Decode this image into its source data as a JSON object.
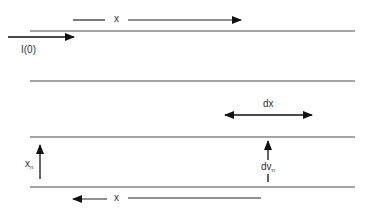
{
  "diagram": {
    "type": "transmission-line-schematic",
    "colors": {
      "line": "#4a4a4a",
      "arrow": "#111111",
      "text": "#333333",
      "background": "#ffffff"
    },
    "conductors": [
      {
        "id": "line-1",
        "y": 31,
        "x1": 30,
        "x2": 355
      },
      {
        "id": "line-2",
        "y": 81,
        "x1": 30,
        "x2": 355
      },
      {
        "id": "line-3",
        "y": 137,
        "x1": 30,
        "x2": 355
      },
      {
        "id": "line-4",
        "y": 187,
        "x1": 30,
        "x2": 355
      }
    ],
    "labels": {
      "top_x": "x",
      "current": "I(0)",
      "dx": "dx",
      "xn_main": "x",
      "xn_sub": "n",
      "dvn_main": "dv",
      "dvn_sub": "n",
      "bottom_x": "x"
    },
    "arrows": [
      {
        "id": "top-x-arrow",
        "direction": "right",
        "label": "x"
      },
      {
        "id": "current-arrow",
        "direction": "right",
        "label": "I(0)"
      },
      {
        "id": "dx-arrow",
        "direction": "both",
        "label": "dx"
      },
      {
        "id": "xn-arrow",
        "direction": "up",
        "label": "x_n"
      },
      {
        "id": "dvn-arrow",
        "direction": "up",
        "label": "dv_n"
      },
      {
        "id": "bottom-x-arrow",
        "direction": "left",
        "label": "x"
      }
    ]
  }
}
